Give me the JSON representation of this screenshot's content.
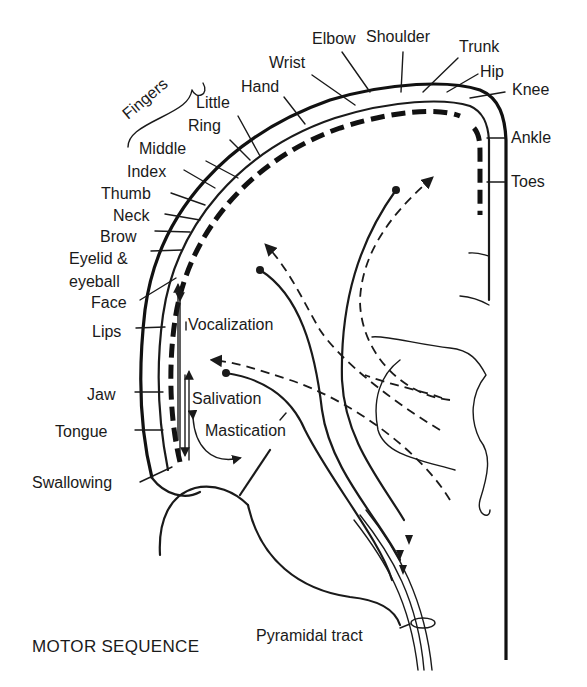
{
  "title": "MOTOR SEQUENCE",
  "body_parts_top": [
    {
      "label": "Elbow",
      "x": 312,
      "y": 44
    },
    {
      "label": "Shoulder",
      "x": 366,
      "y": 42
    },
    {
      "label": "Trunk",
      "x": 459,
      "y": 52
    },
    {
      "label": "Hip",
      "x": 480,
      "y": 77
    },
    {
      "label": "Knee",
      "x": 512,
      "y": 95
    },
    {
      "label": "Ankle",
      "x": 511,
      "y": 143
    },
    {
      "label": "Toes",
      "x": 511,
      "y": 187
    }
  ],
  "body_parts_arc": [
    {
      "label": "Wrist",
      "x": 269,
      "y": 68
    },
    {
      "label": "Hand",
      "x": 241,
      "y": 92
    },
    {
      "label": "Little",
      "x": 196,
      "y": 108
    },
    {
      "label": "Ring",
      "x": 188,
      "y": 131
    },
    {
      "label": "Middle",
      "x": 139,
      "y": 154
    },
    {
      "label": "Index",
      "x": 127,
      "y": 177
    },
    {
      "label": "Thumb",
      "x": 101,
      "y": 199
    },
    {
      "label": "Neck",
      "x": 113,
      "y": 221
    },
    {
      "label": "Brow",
      "x": 100,
      "y": 242
    },
    {
      "label": "Eyelid &",
      "x": 69,
      "y": 264
    },
    {
      "label": "eyeball",
      "x": 69,
      "y": 287
    },
    {
      "label": "Face",
      "x": 91,
      "y": 308
    }
  ],
  "fingers_label": "Fingers",
  "body_parts_left": [
    {
      "label": "Lips",
      "x": 92,
      "y": 337
    },
    {
      "label": "Jaw",
      "x": 87,
      "y": 400
    },
    {
      "label": "Tongue",
      "x": 55,
      "y": 437
    },
    {
      "label": "Swallowing",
      "x": 32,
      "y": 488
    }
  ],
  "functions": [
    {
      "label": "Vocalization",
      "x": 188,
      "y": 330
    },
    {
      "label": "Salivation",
      "x": 192,
      "y": 404
    },
    {
      "label": "Mastication",
      "x": 205,
      "y": 436
    }
  ],
  "tract_label": "Pyramidal tract",
  "colors": {
    "ink": "#1a1a1a",
    "background": "#ffffff"
  }
}
